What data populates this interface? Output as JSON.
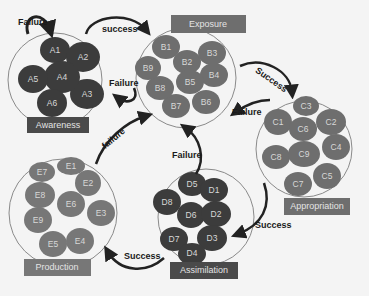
{
  "diagram": {
    "colors": {
      "background": "#f4f4f4",
      "awareness_node": "#3c3c3c",
      "default_node": "#6e6e6e",
      "dark_label": "#4a4a4a",
      "light_label": "#777777",
      "arrow": "#222222",
      "group_outline": "#8a8a8a"
    },
    "groups": [
      {
        "id": "A",
        "label": "Awareness",
        "nodes": [
          "A1",
          "A2",
          "A3",
          "A4",
          "A5",
          "A6"
        ]
      },
      {
        "id": "B",
        "label": "Exposure",
        "nodes": [
          "B1",
          "B2",
          "B3",
          "B4",
          "B5",
          "B6",
          "B7",
          "B8",
          "B9"
        ]
      },
      {
        "id": "C",
        "label": "Appropriation",
        "nodes": [
          "C1",
          "C2",
          "C3",
          "C4",
          "C5",
          "C6",
          "C7",
          "C8",
          "C9"
        ]
      },
      {
        "id": "D",
        "label": "Assimilation",
        "nodes": [
          "D1",
          "D2",
          "D3",
          "D4",
          "D5",
          "D6",
          "D7",
          "D8"
        ]
      },
      {
        "id": "E",
        "label": "Production",
        "nodes": [
          "E1",
          "E2",
          "E3",
          "E4",
          "E5",
          "E6",
          "E7",
          "E8",
          "E9"
        ]
      }
    ],
    "edges": [
      {
        "from": "A",
        "to": "A",
        "label": "Failure"
      },
      {
        "from": "A",
        "to": "B",
        "label": "success"
      },
      {
        "from": "B",
        "to": "A",
        "label": "Failure"
      },
      {
        "from": "B",
        "to": "C",
        "label": "Success"
      },
      {
        "from": "C",
        "to": "B",
        "label": "Failure"
      },
      {
        "from": "C",
        "to": "D",
        "label": "Success"
      },
      {
        "from": "D",
        "to": "B",
        "label": "Failure"
      },
      {
        "from": "D",
        "to": "E",
        "label": "Success"
      },
      {
        "from": "E",
        "to": "B",
        "label": "failure"
      }
    ]
  }
}
